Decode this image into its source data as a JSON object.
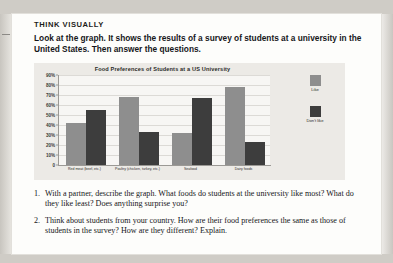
{
  "section": {
    "heading": "THINK VISUALLY",
    "intro": "Look at the graph. It shows the results of a survey of students at a university in the United States. Then answer the questions."
  },
  "chart_data": {
    "type": "bar",
    "title": "Food Preferences of Students at a US University",
    "categories": [
      "Red meat (beef, etc.)",
      "Poultry (chicken, turkey, etc.)",
      "Seafood",
      "Dairy foods"
    ],
    "series": [
      {
        "name": "Like",
        "values": [
          42,
          68,
          32,
          78
        ],
        "color": "#8e8e8e"
      },
      {
        "name": "Don't like",
        "values": [
          55,
          33,
          67,
          23
        ],
        "color": "#3d3d3d"
      }
    ],
    "ylabel": "",
    "xlabel": "",
    "ylim": [
      0,
      90
    ],
    "yticks": [
      "0",
      "10%",
      "20%",
      "30%",
      "40%",
      "50%",
      "60%",
      "70%",
      "80%",
      "90%"
    ],
    "grid": true,
    "legend_position": "right"
  },
  "questions": [
    {
      "number": "1.",
      "text": "With a partner, describe the graph. What foods do students at the university like most? What do they like least? Does anything surprise you?"
    },
    {
      "number": "2.",
      "text": "Think about students from your country. How are their food preferences the same as those of students in the survey? How are they different? Explain."
    }
  ]
}
